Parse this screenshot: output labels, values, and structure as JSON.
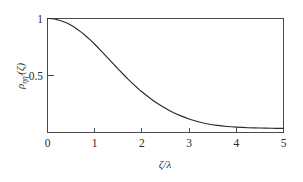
{
  "chart_data": {
    "type": "line",
    "title": "",
    "subtitle": "",
    "xlabel": "ζ/λ",
    "ylabel": "ρ_ηη'(ζ)",
    "ylabel_parts": {
      "symbol": "ρ",
      "subscript": "ηη'",
      "argument": "(ζ)"
    },
    "xlabel_parts": {
      "numerator": "ζ",
      "slash": "/",
      "denominator": "λ"
    },
    "xlim": [
      0,
      5
    ],
    "ylim": [
      0,
      1
    ],
    "xticks": [
      0,
      1,
      2,
      3,
      4,
      5
    ],
    "xtick_labels": [
      "0",
      "1",
      "2",
      "3",
      "4",
      "5"
    ],
    "yticks": [
      0.5,
      1
    ],
    "ytick_labels": [
      "0.5",
      "1"
    ],
    "grid": false,
    "legend": null,
    "frame": "box",
    "tick_direction": "in",
    "series": [
      {
        "name": "correlation",
        "color": "#2b2b2b",
        "x": [
          0,
          0.1,
          0.2,
          0.3,
          0.4,
          0.5,
          0.6,
          0.7,
          0.8,
          0.9,
          1.0,
          1.1,
          1.2,
          1.3,
          1.4,
          1.5,
          1.6,
          1.7,
          1.8,
          1.9,
          2.0,
          2.2,
          2.4,
          2.6,
          2.8,
          3.0,
          3.2,
          3.4,
          3.6,
          3.8,
          4.0,
          4.25,
          4.5,
          4.75,
          5.0
        ],
        "values": [
          1.0,
          0.998,
          0.99,
          0.978,
          0.962,
          0.941,
          0.915,
          0.885,
          0.851,
          0.814,
          0.774,
          0.732,
          0.688,
          0.644,
          0.6,
          0.556,
          0.513,
          0.471,
          0.431,
          0.393,
          0.357,
          0.292,
          0.236,
          0.189,
          0.15,
          0.119,
          0.094,
          0.075,
          0.062,
          0.053,
          0.047,
          0.042,
          0.039,
          0.037,
          0.036
        ]
      }
    ]
  },
  "figure": {
    "background_color": "#ffffff",
    "axis_color": "#4a4a4a",
    "curve_color": "#2b2b2b"
  }
}
